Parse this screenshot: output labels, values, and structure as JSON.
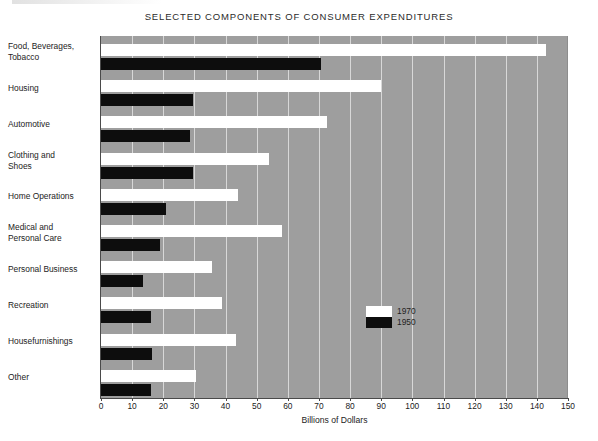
{
  "chart_data": {
    "type": "bar",
    "orientation": "horizontal",
    "title": "SELECTED COMPONENTS OF CONSUMER EXPENDITURES",
    "xlabel": "Billions of Dollars",
    "ylabel": "",
    "xlim": [
      0,
      150
    ],
    "xticks": [
      0,
      10,
      20,
      30,
      40,
      50,
      60,
      70,
      80,
      90,
      100,
      110,
      120,
      130,
      140,
      150
    ],
    "xtick_labels": [
      "0",
      "10",
      "20",
      "30",
      "40",
      "50",
      "60",
      "70",
      "80",
      "90",
      "100",
      "110",
      "120",
      "130",
      "140",
      "150"
    ],
    "grid": true,
    "grid_axis": "x",
    "plot_background": "#9e9e9e",
    "gridline_color": "#d8d8d8",
    "legend_position": "center",
    "categories": [
      "Food, Beverages,\nTobacco",
      "Housing",
      "Automotive",
      "Clothing and\nShoes",
      "Home Operations",
      "Medical and\nPersonal Care",
      "Personal Business",
      "Recreation",
      "Housefurnishings",
      "Other"
    ],
    "category_labels": [
      [
        "Food, Beverages,",
        "Tobacco"
      ],
      [
        "Housing"
      ],
      [
        "Automotive"
      ],
      [
        "Clothing and",
        "Shoes"
      ],
      [
        "Home Operations"
      ],
      [
        "Medical and",
        "Personal Care"
      ],
      [
        "Personal Business"
      ],
      [
        "Recreation"
      ],
      [
        "Housefurnishings"
      ],
      [
        "Other"
      ]
    ],
    "series": [
      {
        "name": "1970",
        "color": "#ffffff",
        "values": [
          143,
          90,
          72.5,
          54,
          44,
          58,
          35.5,
          39,
          43.5,
          30.5
        ]
      },
      {
        "name": "1950",
        "color": "#0d0d0d",
        "values": [
          70.5,
          29.5,
          28.5,
          29.5,
          21,
          19,
          13.5,
          16,
          16.5,
          16
        ]
      }
    ],
    "legend": [
      {
        "label": "1970",
        "color": "#ffffff"
      },
      {
        "label": "1950",
        "color": "#0d0d0d"
      }
    ]
  }
}
